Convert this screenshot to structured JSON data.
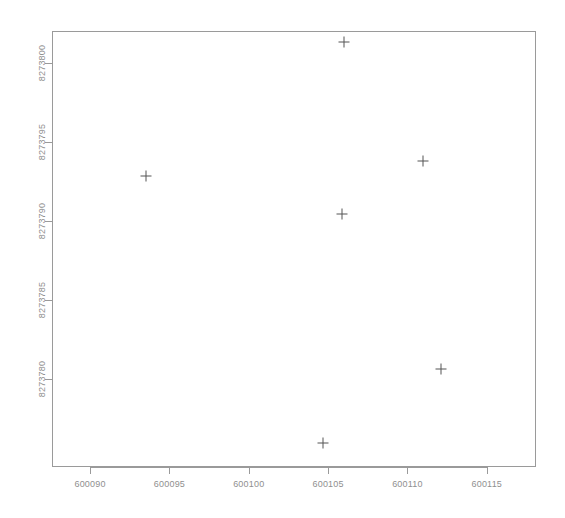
{
  "chart_data": {
    "type": "scatter",
    "title": "",
    "subtitle": "",
    "xlabel": "",
    "ylabel": "",
    "grid": false,
    "legend": null,
    "legend_position": "none",
    "marker": "plus",
    "marker_color": "#555555",
    "box_color": "#9a9a9a",
    "label_color": "#8f8f8f",
    "background": "#ffffff",
    "xlim": [
      600087.6,
      600118.1
    ],
    "ylim": [
      8273774.4,
      8273802.0
    ],
    "xticks": [
      600090,
      600095,
      600100,
      600105,
      600110,
      600115
    ],
    "yticks": [
      8273780,
      8273785,
      8273790,
      8273795,
      8273800
    ],
    "xtick_labels": [
      "600090",
      "600095",
      "600100",
      "600105",
      "600110",
      "600115"
    ],
    "ytick_labels": [
      "8273780",
      "8273785",
      "8273790",
      "8273795",
      "8273800"
    ],
    "points": [
      {
        "x": 600106.0,
        "y": 8273801.3
      },
      {
        "x": 600093.5,
        "y": 8273792.8
      },
      {
        "x": 600111.0,
        "y": 8273793.8
      },
      {
        "x": 600105.9,
        "y": 8273790.4
      },
      {
        "x": 600112.1,
        "y": 8273780.6
      },
      {
        "x": 600104.7,
        "y": 8273775.9
      }
    ],
    "n_points": 6
  }
}
